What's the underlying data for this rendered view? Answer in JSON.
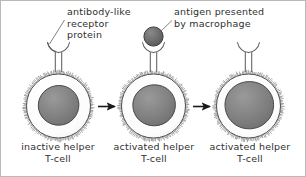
{
  "figure": {
    "background_color": "#ffffff",
    "border_color": "#b9b9b9",
    "text_color": "#2f2f2f"
  },
  "callouts": [
    {
      "name": "antibody-like-receptor-protein",
      "lines": [
        "antibody-like",
        "receptor",
        "protein"
      ],
      "leader_line": true,
      "points_to": "receptor-cell-1"
    },
    {
      "name": "antigen-presented-by-macrophage",
      "lines": [
        "antigen presented",
        "by macrophage"
      ],
      "leader_line": true,
      "points_to": "antigen-cell-2"
    }
  ],
  "cells": [
    {
      "name": "inactive-helper-t-cell",
      "caption_lines": [
        "inactive helper",
        "T-cell"
      ],
      "has_antigen": false,
      "membrane_color": "#fbfbfb",
      "membrane_stroke": "#5a5a5a",
      "nucleus_color": "#7e7e7e",
      "nucleus_stroke": "#4a4a4a",
      "nucleus_relative_size": "medium"
    },
    {
      "name": "activated-helper-t-cell-middle",
      "caption_lines": [
        "activated helper",
        "T-cell"
      ],
      "has_antigen": true,
      "antigen_color": "#6b6b6b",
      "antigen_stroke": "#3d3d3d",
      "membrane_color": "#fbfbfb",
      "membrane_stroke": "#5a5a5a",
      "nucleus_color": "#7e7e7e",
      "nucleus_stroke": "#4a4a4a",
      "nucleus_relative_size": "medium"
    },
    {
      "name": "activated-helper-t-cell-right",
      "caption_lines": [
        "activated helper",
        "T-cell"
      ],
      "has_antigen": false,
      "membrane_color": "#fbfbfb",
      "membrane_stroke": "#5a5a5a",
      "nucleus_color": "#7e7e7e",
      "nucleus_stroke": "#4a4a4a",
      "nucleus_relative_size": "large"
    }
  ],
  "arrows": [
    {
      "name": "arrow-cell1-to-cell2",
      "direction": "right",
      "color": "#1a1a1a"
    },
    {
      "name": "arrow-cell2-to-cell3",
      "direction": "right",
      "color": "#1a1a1a"
    }
  ],
  "receptors": [
    {
      "name": "receptor-cell-1",
      "shape": "y-shaped-cup",
      "stroke": "#5f5f5f"
    },
    {
      "name": "receptor-cell-2",
      "shape": "y-shaped-cup",
      "stroke": "#5f5f5f"
    },
    {
      "name": "receptor-cell-3",
      "shape": "y-shaped-cup",
      "stroke": "#5f5f5f"
    }
  ]
}
